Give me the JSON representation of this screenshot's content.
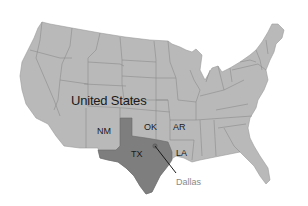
{
  "map": {
    "country_label": "United States",
    "states": [
      {
        "code": "NM",
        "label": "NM"
      },
      {
        "code": "OK",
        "label": "OK"
      },
      {
        "code": "AR",
        "label": "AR"
      },
      {
        "code": "TX",
        "label": "TX"
      },
      {
        "code": "LA",
        "label": "LA"
      }
    ],
    "city": {
      "label": "Dallas"
    },
    "colors": {
      "land": "#b9b9b9",
      "highlight": "#7e7e7e",
      "border": "#8c8c8c",
      "city_text": "#8a8a8a",
      "label_text": "#1a1a1a"
    }
  }
}
